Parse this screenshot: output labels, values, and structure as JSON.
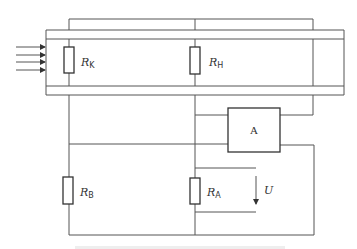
{
  "diagram": {
    "type": "circuit-schematic",
    "components": {
      "rk": {
        "symbol": "R",
        "subscript": "K"
      },
      "rh": {
        "symbol": "R",
        "subscript": "H"
      },
      "rb": {
        "symbol": "R",
        "subscript": "B"
      },
      "ra": {
        "symbol": "R",
        "subscript": "A"
      },
      "amplifier": {
        "label": "A"
      },
      "voltage": {
        "label": "U"
      }
    },
    "incoming_flow_arrows": 4,
    "caption": ""
  }
}
